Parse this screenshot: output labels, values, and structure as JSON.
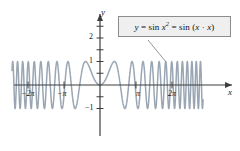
{
  "figure": {
    "kind": "math-function-plot",
    "background_color": "#ffffff",
    "curve_color": "#9aa6b4",
    "axis_color": "#3d3d3d"
  },
  "callout": {
    "name": "function-equation-label",
    "text": "y = sin x² = sin (x · x)",
    "lhs": "y",
    "equals": "=",
    "expr1": "sin x",
    "expr1_exponent": "2",
    "expr2": "sin (x · x)",
    "box_fill": "#efefef",
    "box_border": "#8c8c8c"
  },
  "axes": {
    "x_axis_label": "x",
    "y_axis_label": "y",
    "x_ticks": [
      {
        "label": "−2π",
        "value": -6.2832
      },
      {
        "label": "−π",
        "value": -3.1416
      },
      {
        "label": "π",
        "value": 3.1416
      },
      {
        "label": "2π",
        "value": 6.2832
      }
    ],
    "y_ticks": [
      {
        "label": "2",
        "value": 2
      },
      {
        "label": "1",
        "value": 1
      },
      {
        "label": "−1",
        "value": -1
      }
    ]
  },
  "chart_data": {
    "type": "line",
    "title": "",
    "subtitle": "",
    "xlabel": "x",
    "ylabel": "y",
    "function": "y = sin(x^2)",
    "equation_display": "y = sin x² = sin (x · x)",
    "xlim": [
      -9.0,
      9.0
    ],
    "ylim": [
      -1.6,
      2.6
    ],
    "grid": false,
    "legend": "none",
    "annotations": [
      {
        "text": "y = sin x² = sin (x · x)",
        "type": "callout-box",
        "points_to_x": 5.6,
        "points_to_y": 1.0
      }
    ],
    "xtick_values": [
      -6.2832,
      -3.1416,
      3.1416,
      6.2832
    ],
    "xtick_labels": [
      "−2π",
      "−π",
      "π",
      "2π"
    ],
    "ytick_values": [
      2,
      1,
      -1
    ],
    "ytick_labels": [
      "2",
      "1",
      "−1"
    ],
    "sample_points": [
      {
        "x": -9.0,
        "y": 0.6298
      },
      {
        "x": -8.5,
        "y": -0.9041
      },
      {
        "x": -8.0,
        "y": -0.9918
      },
      {
        "x": -7.5,
        "y": 0.5744
      },
      {
        "x": -7.0,
        "y": 0.9227
      },
      {
        "x": -6.5,
        "y": -0.857
      },
      {
        "x": -6.0,
        "y": -0.9918
      },
      {
        "x": -5.5,
        "y": 0.9983
      },
      {
        "x": -5.0,
        "y": -0.1324
      },
      {
        "x": -4.5,
        "y": -0.9719
      },
      {
        "x": -4.0,
        "y": -0.2879
      },
      {
        "x": -3.5,
        "y": 0.1165
      },
      {
        "x": -3.0,
        "y": 0.4121
      },
      {
        "x": -2.5,
        "y": 0.0332
      },
      {
        "x": -2.0,
        "y": -0.7568
      },
      {
        "x": -1.5,
        "y": 0.7781
      },
      {
        "x": -1.0,
        "y": 0.8415
      },
      {
        "x": -0.5,
        "y": 0.2474
      },
      {
        "x": 0.0,
        "y": 0.0
      },
      {
        "x": 0.5,
        "y": 0.2474
      },
      {
        "x": 1.0,
        "y": 0.8415
      },
      {
        "x": 1.5,
        "y": 0.7781
      },
      {
        "x": 2.0,
        "y": -0.7568
      },
      {
        "x": 2.5,
        "y": 0.0332
      },
      {
        "x": 3.0,
        "y": 0.4121
      },
      {
        "x": 3.5,
        "y": 0.1165
      },
      {
        "x": 4.0,
        "y": -0.2879
      },
      {
        "x": 4.5,
        "y": -0.9719
      },
      {
        "x": 5.0,
        "y": -0.1324
      },
      {
        "x": 5.5,
        "y": 0.9983
      },
      {
        "x": 6.0,
        "y": -0.9918
      },
      {
        "x": 6.5,
        "y": -0.857
      },
      {
        "x": 7.0,
        "y": 0.9227
      },
      {
        "x": 7.5,
        "y": 0.5744
      },
      {
        "x": 8.0,
        "y": -0.9918
      },
      {
        "x": 8.5,
        "y": -0.9041
      },
      {
        "x": 9.0,
        "y": 0.6298
      }
    ]
  }
}
